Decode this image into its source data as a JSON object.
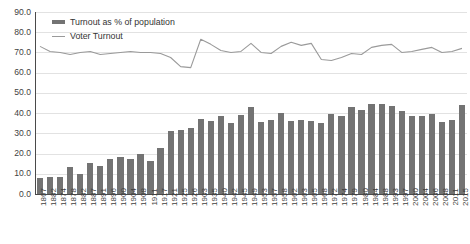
{
  "chart_data": {
    "type": "bar",
    "title": "",
    "xlabel": "",
    "ylabel": "",
    "ylim": [
      0,
      90
    ],
    "yticks": [
      "0.0",
      "10.0",
      "20.0",
      "30.0",
      "40.0",
      "50.0",
      "60.0",
      "70.0",
      "80.0",
      "90.0"
    ],
    "grid": true,
    "legend_position": "top-left",
    "categories": [
      "1867",
      "1882",
      "1874",
      "1878",
      "1882",
      "1887",
      "1891",
      "1896",
      "1900",
      "1904",
      "1908",
      "1911",
      "1917",
      "1921",
      "1925",
      "1926",
      "1903",
      "1935",
      "1940",
      "1942",
      "1945",
      "1949",
      "1953",
      "1957",
      "1958",
      "1962",
      "1963",
      "1965",
      "1968",
      "1972",
      "1974",
      "1979",
      "1980",
      "1984",
      "1988",
      "1993",
      "1997",
      "2000",
      "2004",
      "2006",
      "2008",
      "2011",
      "2015"
    ],
    "series": [
      {
        "name": "Turnout as % of population",
        "type": "bar",
        "color": "#737373",
        "values": [
          8.0,
          8.5,
          8.5,
          13.5,
          10.0,
          15.5,
          14.0,
          17.5,
          18.5,
          17.5,
          20.0,
          16.5,
          23.0,
          31.0,
          31.5,
          32.5,
          37.0,
          36.0,
          38.5,
          35.0,
          39.0,
          43.0,
          35.5,
          36.5,
          40.0,
          36.0,
          36.5,
          36.0,
          35.0,
          39.5,
          38.5,
          43.0,
          41.5,
          44.5,
          44.5,
          43.5,
          41.0,
          38.5,
          38.5,
          39.5,
          35.5,
          36.5,
          44.0
        ],
        "ymax_ref": 90
      },
      {
        "name": "Voter Turnout",
        "type": "line",
        "color": "#9a9a9a",
        "values": [
          73.0,
          70.5,
          70.0,
          69.0,
          70.0,
          70.5,
          69.0,
          69.5,
          70.0,
          70.5,
          70.0,
          70.0,
          69.5,
          67.5,
          63.0,
          62.5,
          76.5,
          74.0,
          71.0,
          70.0,
          70.5,
          74.5,
          70.0,
          69.5,
          73.0,
          75.0,
          73.5,
          74.5,
          66.5,
          66.0,
          67.5,
          69.5,
          69.0,
          72.5,
          73.5,
          74.0,
          70.0,
          70.5,
          71.5,
          72.5,
          70.0,
          70.5,
          72.0
        ],
        "ymax_ref": 90
      }
    ]
  },
  "legend": {
    "bar_label": "Turnout as % of population",
    "line_label": "Voter Turnout"
  }
}
